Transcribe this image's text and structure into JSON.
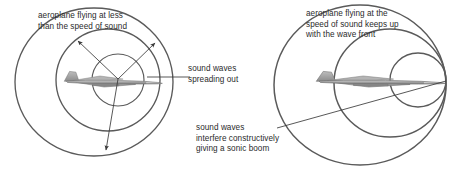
{
  "figure": {
    "background_color": "#ffffff",
    "wave_color": "#555555",
    "leader_color": "#333333",
    "text_color": "#2b2b2b",
    "aircraft_color": "#9a9a9a"
  },
  "left_diagram": {
    "name": "subsonic-flight",
    "caption_title": "aeroplane flying at less\nthan the speed of sound",
    "caption_waves": "sound waves\nspreading out",
    "wavefronts": [
      {
        "cx": 118,
        "cy": 80,
        "rx": 26,
        "ry": 26,
        "label": "innermost-wavefront"
      },
      {
        "cx": 108,
        "cy": 80,
        "rx": 52,
        "ry": 51,
        "label": "middle-wavefront"
      },
      {
        "cx": 94,
        "cy": 82,
        "rx": 79,
        "ry": 74,
        "label": "outermost-wavefront"
      }
    ],
    "aircraft": {
      "x": 58,
      "y": 72,
      "width": 104,
      "height": 18,
      "heading": "right"
    },
    "spread_arrows": [
      {
        "x1": 118,
        "y1": 79,
        "x2": 77,
        "y2": 40
      },
      {
        "x1": 118,
        "y1": 79,
        "x2": 156,
        "y2": 42
      },
      {
        "x1": 118,
        "y1": 79,
        "x2": 105,
        "y2": 152
      }
    ],
    "leader_line": {
      "x1": 190,
      "y1": 77,
      "x2": 148,
      "y2": 77
    }
  },
  "right_diagram": {
    "name": "sonic-flight",
    "caption_title": "aeroplane flying at the\nspeed of sound keeps up\nwith the wave front",
    "caption_boom": "sound waves\ninterfere constructively\ngiving a sonic boom",
    "wavefronts": [
      {
        "cx": 418,
        "cy": 80,
        "rx": 28,
        "ry": 27,
        "label": "innermost-wavefront"
      },
      {
        "cx": 390,
        "cy": 83,
        "rx": 56,
        "ry": 54,
        "label": "middle-wavefront"
      },
      {
        "cx": 360,
        "cy": 85,
        "rx": 86,
        "ry": 80,
        "label": "outermost-wavefront"
      }
    ],
    "aircraft": {
      "x": 308,
      "y": 72,
      "width": 138,
      "height": 18,
      "heading": "right"
    },
    "leader_line": {
      "x1": 277,
      "y1": 128,
      "x2": 446,
      "y2": 81
    }
  }
}
